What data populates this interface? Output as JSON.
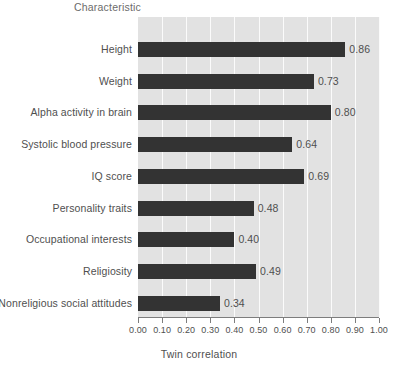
{
  "chart_data": {
    "type": "bar",
    "orientation": "horizontal",
    "title": "",
    "category_axis_title": "Characteristic",
    "xlabel": "Twin correlation",
    "ylabel": "",
    "xlim": [
      0.0,
      1.0
    ],
    "xticks": [
      "0.00",
      "0.10",
      "0.20",
      "0.30",
      "0.40",
      "0.50",
      "0.60",
      "0.70",
      "0.80",
      "0.90",
      "1.00"
    ],
    "grid": "vertical",
    "legend": "none",
    "categories": [
      "Height",
      "Weight",
      "Alpha activity in brain",
      "Systolic blood pressure",
      "IQ score",
      "Personality traits",
      "Occupational interests",
      "Religiosity",
      "Nonreligious social attitudes"
    ],
    "values": [
      0.86,
      0.73,
      0.8,
      0.64,
      0.69,
      0.48,
      0.4,
      0.49,
      0.34
    ],
    "value_labels": [
      "0.86",
      "0.73",
      "0.80",
      "0.64",
      "0.69",
      "0.48",
      "0.40",
      "0.49",
      "0.34"
    ],
    "colors": {
      "bar": "#333333",
      "plot_background": "#e2e2e2",
      "gridline": "#fbfbfb",
      "axis": "#7d7d7d",
      "text": "#4f4f4f",
      "page_background": "#ffffff"
    }
  }
}
